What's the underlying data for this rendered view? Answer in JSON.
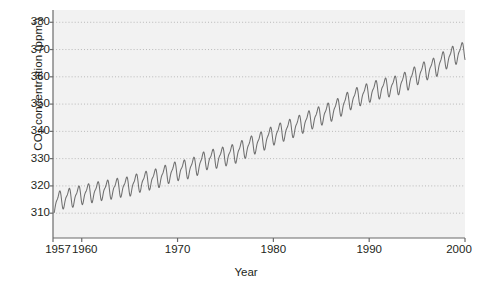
{
  "chart_data": {
    "type": "line",
    "title": "",
    "subtitle": "",
    "xlabel": "Year",
    "ylabel": "CO2 concentration (ppm*)",
    "ylabel_parts": {
      "prefix": "CO",
      "subscript": "2",
      "middle": " concentration (ppm",
      "superscript": "*",
      "suffix": ")"
    },
    "xlim": [
      1957,
      2000
    ],
    "ylim": [
      300.9,
      384.5
    ],
    "xticks": [
      1957,
      1960,
      1970,
      1980,
      1990,
      2000
    ],
    "xtick_labels": [
      "1957",
      "1960",
      "1970",
      "1980",
      "1990",
      "2000"
    ],
    "yticks": [
      310,
      320,
      330,
      340,
      350,
      360,
      370,
      380
    ],
    "ytick_labels": [
      "310",
      "320",
      "330",
      "340",
      "350",
      "360",
      "370",
      "380"
    ],
    "grid": "horizontal-dotted",
    "legend": "none",
    "annotations": [],
    "series": [
      {
        "name": "Atmospheric CO2 (Mauna Loa monthly mean)",
        "color": "#6f6f6f",
        "seasonal_amplitude_ppm": 3.1,
        "x": [
          1957.5,
          1958,
          1959,
          1960,
          1961,
          1962,
          1963,
          1964,
          1965,
          1966,
          1967,
          1968,
          1969,
          1970,
          1971,
          1972,
          1973,
          1974,
          1975,
          1976,
          1977,
          1978,
          1979,
          1980,
          1981,
          1982,
          1983,
          1984,
          1985,
          1986,
          1987,
          1988,
          1989,
          1990,
          1991,
          1992,
          1993,
          1994,
          1995,
          1996,
          1997,
          1998,
          1999,
          2000
        ],
        "values": [
          314.4,
          315.3,
          315.9,
          316.9,
          317.6,
          318.4,
          318.9,
          319.6,
          320.0,
          321.4,
          322.2,
          323.1,
          324.6,
          325.7,
          326.3,
          327.5,
          329.7,
          330.2,
          331.1,
          332.0,
          333.8,
          335.4,
          336.8,
          338.7,
          340.1,
          341.4,
          343.0,
          344.6,
          346.0,
          347.4,
          349.2,
          351.6,
          353.1,
          354.4,
          355.6,
          356.4,
          357.1,
          358.8,
          360.8,
          362.6,
          363.8,
          366.6,
          368.3,
          369.5
        ]
      }
    ]
  },
  "axis_style": {
    "plot_bg": "#f2f2f2",
    "page_bg": "#ffffff",
    "axis_color": "#6b6b6b",
    "grid_color": "#b9b9b9",
    "text_color": "#231f20"
  }
}
